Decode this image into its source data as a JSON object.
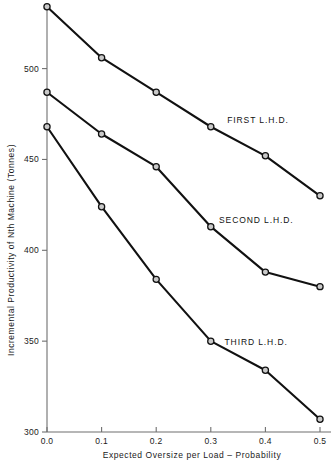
{
  "chart_data": {
    "type": "line",
    "title": "",
    "xlabel": "Expected Oversize per Load – Probability",
    "ylabel": "Incremental Productivity of Nth Machine (Tonnes)",
    "x": [
      0.0,
      0.1,
      0.2,
      0.3,
      0.4,
      0.5
    ],
    "xticklabels": [
      "0.0",
      "0.1",
      "0.2",
      "0.3",
      "0.4",
      "0.5"
    ],
    "yticks": [
      300,
      350,
      400,
      450,
      500
    ],
    "yticklabels": [
      "300",
      "350",
      "400",
      "450",
      "500"
    ],
    "xlim": [
      0.0,
      0.5
    ],
    "ylim": [
      300,
      535
    ],
    "grid": false,
    "legend": "inline-annotations",
    "marker": "open-circle",
    "series": [
      {
        "name": "FIRST L.H.D.",
        "values": [
          534,
          506,
          487,
          468,
          452,
          430
        ],
        "label_x": 0.33,
        "label_y": 470
      },
      {
        "name": "SECOND L.H.D.",
        "values": [
          487,
          464,
          446,
          413,
          388,
          380
        ],
        "label_x": 0.315,
        "label_y": 415
      },
      {
        "name": "THIRD L.H.D.",
        "values": [
          468,
          424,
          384,
          350,
          334,
          307
        ],
        "label_x": 0.325,
        "label_y": 348
      }
    ]
  },
  "axis": {
    "y_tick_0": "300",
    "y_tick_1": "350",
    "y_tick_2": "400",
    "y_tick_3": "450",
    "y_tick_4": "500",
    "x_tick_0": "0.0",
    "x_tick_1": "0.1",
    "x_tick_2": "0.2",
    "x_tick_3": "0.3",
    "x_tick_4": "0.4",
    "x_tick_5": "0.5"
  },
  "colors": {
    "line": "#111111",
    "marker_fill": "#c9c9c9",
    "axis": "#6f6f6f",
    "text": "#1a1a1a",
    "background": "#ffffff"
  }
}
